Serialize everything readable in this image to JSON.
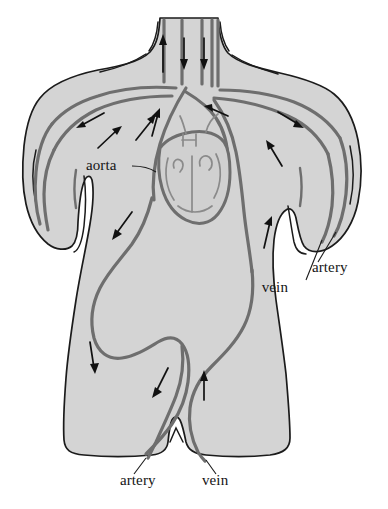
{
  "figure": {
    "background_color": "#ffffff",
    "body_fill_color": "#d4d4d4",
    "outline_color": "#1b1b1b",
    "vessel_color": "#6e6e6e",
    "arrow_color": "#111111",
    "label_color": "#141414"
  },
  "labels": {
    "aorta": "aorta",
    "arm_artery": "artery",
    "arm_vein": "vein",
    "leg_artery": "artery",
    "leg_vein": "vein"
  },
  "label_positions": {
    "aorta": {
      "x": 86,
      "y": 170
    },
    "arm_artery": {
      "x": 312,
      "y": 272
    },
    "arm_vein": {
      "x": 288,
      "y": 292
    },
    "leg_artery": {
      "x": 120,
      "y": 485
    },
    "leg_vein": {
      "x": 202,
      "y": 485
    }
  },
  "anatomy": {
    "organs": [
      "heart"
    ],
    "vessel_types": [
      "artery",
      "vein",
      "aorta"
    ],
    "regions": [
      "neck",
      "left-shoulder",
      "right-shoulder",
      "left-arm",
      "right-arm",
      "torso",
      "abdomen",
      "left-leg",
      "right-leg"
    ]
  },
  "flow_arrows": [
    {
      "region": "neck",
      "direction": "up",
      "vessel": "vein"
    },
    {
      "region": "neck",
      "direction": "down",
      "vessel": "artery"
    },
    {
      "region": "neck",
      "direction": "down",
      "vessel": "artery"
    },
    {
      "region": "left-shoulder",
      "direction": "down-left",
      "vessel": "vein"
    },
    {
      "region": "left-shoulder",
      "direction": "up-right",
      "vessel": "artery"
    },
    {
      "region": "left-shoulder",
      "direction": "up-right",
      "vessel": "artery"
    },
    {
      "region": "aortic-arch",
      "direction": "up",
      "vessel": "aorta"
    },
    {
      "region": "aortic-arch",
      "direction": "left",
      "vessel": "aorta"
    },
    {
      "region": "right-shoulder",
      "direction": "down-right",
      "vessel": "artery"
    },
    {
      "region": "right-shoulder",
      "direction": "up-left",
      "vessel": "vein"
    },
    {
      "region": "right-arm",
      "direction": "up",
      "vessel": "vein"
    },
    {
      "region": "torso-left",
      "direction": "down-left",
      "vessel": "artery"
    },
    {
      "region": "abdomen-left",
      "direction": "down",
      "vessel": "artery"
    },
    {
      "region": "leg-left",
      "direction": "down-left",
      "vessel": "artery"
    },
    {
      "region": "leg-right",
      "direction": "up",
      "vessel": "vein"
    }
  ]
}
